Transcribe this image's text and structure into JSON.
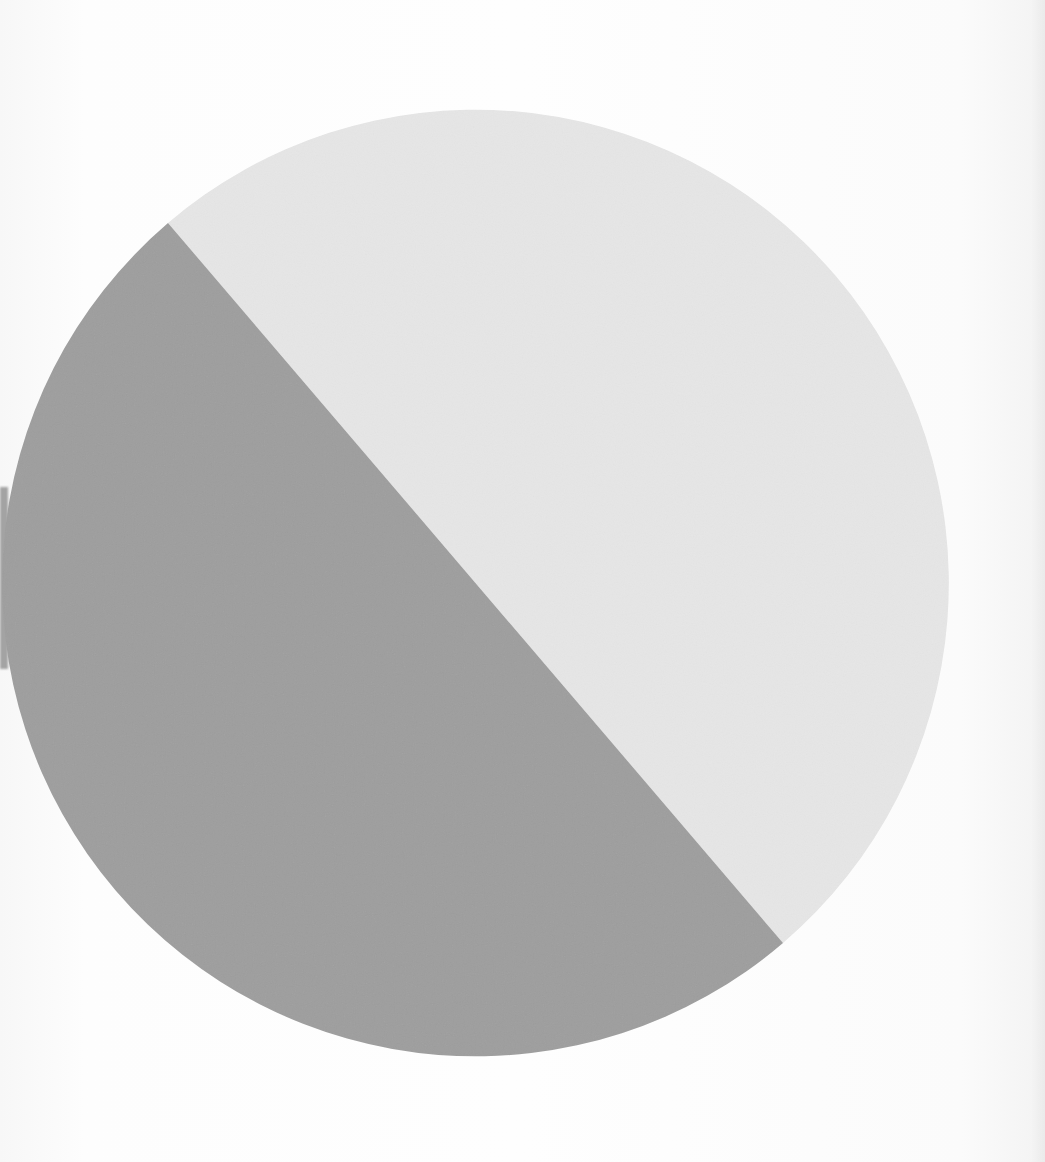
{
  "chart_data": {
    "type": "pie",
    "title": "",
    "labels": [
      "Slice A (dark gray, lower-left)",
      "Slice B (light gray, upper-right)"
    ],
    "values": [
      49,
      51
    ],
    "units": "percent (estimated from geometry; no labels shown)",
    "colors": [
      "#9e9e9e",
      "#e6e6e6"
    ],
    "legend": null,
    "annotations": [],
    "geometry": {
      "center": [
        483,
        583
      ],
      "radius": 472,
      "split_line": [
        [
          168,
          223
        ],
        [
          783,
          943
        ]
      ]
    }
  },
  "page": {
    "background": "#fbfbfb",
    "scan_artifact": "dark gray smudge on far left edge"
  }
}
